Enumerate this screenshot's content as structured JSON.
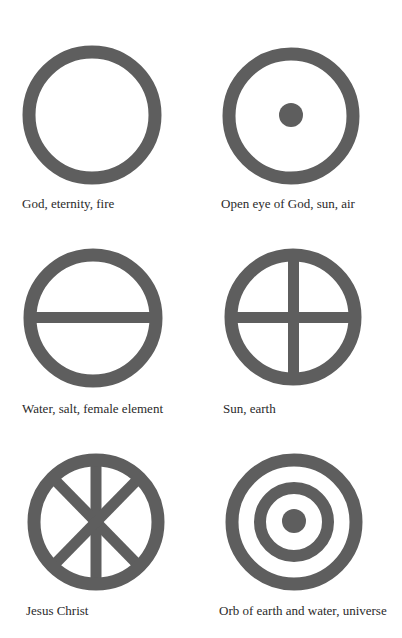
{
  "page": {
    "ink_color": "#5e5e5e",
    "background": "#ffffff"
  },
  "symbols": [
    {
      "icon": "plain-circle-icon",
      "caption": "God, eternity, fire"
    },
    {
      "icon": "circle-with-dot-icon",
      "caption": "Open eye of God, sun, air"
    },
    {
      "icon": "circle-with-horizontal-bar-icon",
      "caption": "Water, salt, female element"
    },
    {
      "icon": "circle-with-cross-icon",
      "caption": "Sun, earth"
    },
    {
      "icon": "circle-with-chi-rho-cross-icon",
      "caption": "Jesus Christ"
    },
    {
      "icon": "concentric-circles-with-dot-icon",
      "caption": "Orb of earth and water, universe"
    }
  ]
}
